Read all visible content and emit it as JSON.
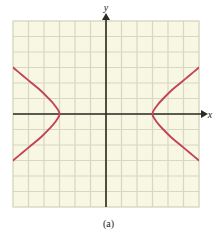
{
  "figure": {
    "caption": "(a)",
    "background_color": "#ffffff",
    "plot_background_color": "#f7f7e3",
    "grid_line_color": "#d8d8c0",
    "axis_color": "#2b2b20",
    "curve_color": "#c2425c"
  },
  "axes": {
    "x_label": "x",
    "y_label": "y",
    "x_arrow": "arrow-right",
    "y_arrow": "arrow-up"
  },
  "chart_data": {
    "type": "line",
    "title": "(a)",
    "xlabel": "x",
    "ylabel": "y",
    "grid": true,
    "legend": "none",
    "xlim": [
      -6,
      6
    ],
    "ylim": [
      -6,
      6
    ],
    "x_gridlines": [
      -6,
      -5,
      -4,
      -3,
      -2,
      -1,
      0,
      1,
      2,
      3,
      4,
      5,
      6
    ],
    "y_gridlines": [
      -6,
      -5,
      -4,
      -3,
      -2,
      -1,
      0,
      1,
      2,
      3,
      4,
      5,
      6
    ],
    "series": [
      {
        "name": "right-branch",
        "vertex": [
          3,
          0
        ],
        "points": [
          [
            6.0,
            3.0
          ],
          [
            5.4,
            2.5
          ],
          [
            4.8,
            2.0
          ],
          [
            4.2,
            1.5
          ],
          [
            3.7,
            1.0
          ],
          [
            3.3,
            0.55
          ],
          [
            3.0,
            0.0
          ],
          [
            3.3,
            -0.55
          ],
          [
            3.7,
            -1.0
          ],
          [
            4.2,
            -1.5
          ],
          [
            4.8,
            -2.0
          ],
          [
            5.4,
            -2.5
          ],
          [
            6.0,
            -3.0
          ]
        ]
      },
      {
        "name": "left-branch",
        "vertex": [
          -3,
          0
        ],
        "points": [
          [
            -6.0,
            3.0
          ],
          [
            -5.4,
            2.5
          ],
          [
            -4.8,
            2.0
          ],
          [
            -4.2,
            1.5
          ],
          [
            -3.7,
            1.0
          ],
          [
            -3.3,
            0.55
          ],
          [
            -3.0,
            0.0
          ],
          [
            -3.3,
            -0.55
          ],
          [
            -3.7,
            -1.0
          ],
          [
            -4.2,
            -1.5
          ],
          [
            -4.8,
            -2.0
          ],
          [
            -5.4,
            -2.5
          ],
          [
            -6.0,
            -3.0
          ]
        ]
      }
    ]
  }
}
